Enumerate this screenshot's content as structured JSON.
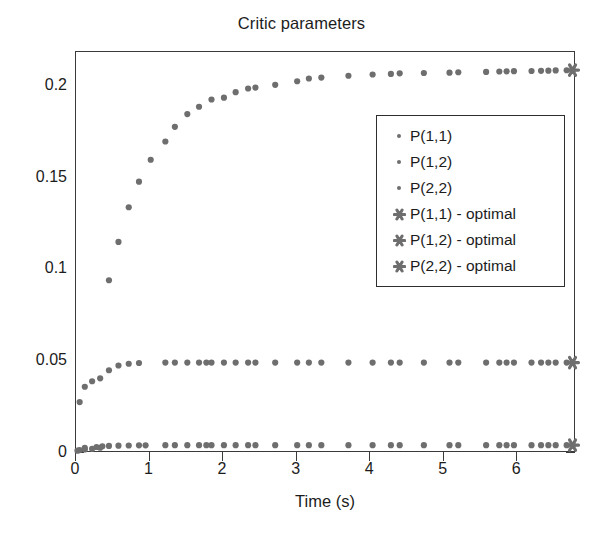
{
  "chart_data": {
    "type": "scatter",
    "title": "Critic parameters",
    "xlabel": "Time (s)",
    "ylabel": "",
    "xlim": [
      0,
      6.8
    ],
    "ylim": [
      0,
      0.2185
    ],
    "xticks": [
      0,
      1,
      2,
      3,
      4,
      5,
      6
    ],
    "xticklabels": [
      "0",
      "1",
      "2",
      "3",
      "4",
      "5",
      "6"
    ],
    "yticks": [
      0,
      0.05,
      0.1,
      0.15,
      0.2
    ],
    "yticklabels": [
      "0",
      "0.05",
      "0.1",
      "0.15",
      "0.2"
    ],
    "grid": false,
    "legend_position": "upper right (inside)",
    "marker_color": "#6e6e6e",
    "axis_color": "#3a3a3a",
    "series": [
      {
        "name": "P(1,1)",
        "marker": "dot",
        "color": "#6e6e6e",
        "x": [
          0.05,
          0.12,
          0.22,
          0.33,
          0.45,
          0.58,
          0.72,
          0.86,
          1.02,
          1.22,
          1.35,
          1.52,
          1.68,
          1.85,
          2.02,
          2.18,
          2.35,
          2.45,
          2.72,
          3.02,
          3.18,
          3.35,
          3.72,
          4.05,
          4.3,
          4.42,
          4.75,
          5.1,
          5.22,
          5.6,
          5.78,
          5.88,
          5.98,
          6.22,
          6.35,
          6.45,
          6.55,
          6.7,
          6.78
        ],
        "y": [
          0.0005,
          0.0008,
          0.0012,
          0.0018,
          0.0935,
          0.1145,
          0.1335,
          0.1475,
          0.1595,
          0.1695,
          0.1775,
          0.1845,
          0.1885,
          0.1925,
          0.1935,
          0.1965,
          0.1985,
          0.199,
          0.2005,
          0.2025,
          0.204,
          0.2045,
          0.2055,
          0.2062,
          0.2065,
          0.2068,
          0.207,
          0.2072,
          0.2074,
          0.2076,
          0.2078,
          0.2079,
          0.208,
          0.2081,
          0.2082,
          0.2083,
          0.2084,
          0.2085,
          0.2086
        ]
      },
      {
        "name": "P(1,2)",
        "marker": "dot",
        "color": "#6e6e6e",
        "x": [
          0.05,
          0.12,
          0.22,
          0.33,
          0.45,
          0.58,
          0.72,
          0.86,
          1.22,
          1.35,
          1.52,
          1.68,
          1.78,
          1.85,
          2.02,
          2.18,
          2.35,
          2.45,
          2.72,
          3.02,
          3.18,
          3.35,
          3.72,
          4.05,
          4.3,
          4.42,
          4.75,
          5.1,
          5.22,
          5.6,
          5.78,
          5.88,
          5.98,
          6.22,
          6.35,
          6.45,
          6.55,
          6.7,
          6.78
        ],
        "y": [
          0.0268,
          0.0352,
          0.0382,
          0.0398,
          0.0442,
          0.0468,
          0.0478,
          0.0482,
          0.0484,
          0.0484,
          0.0484,
          0.0484,
          0.0484,
          0.0484,
          0.0484,
          0.0484,
          0.0484,
          0.0484,
          0.0484,
          0.0484,
          0.0484,
          0.0484,
          0.0484,
          0.0484,
          0.0484,
          0.0484,
          0.0484,
          0.0484,
          0.0484,
          0.0484,
          0.0484,
          0.0484,
          0.0484,
          0.0484,
          0.0484,
          0.0484,
          0.0484,
          0.0484,
          0.0484
        ]
      },
      {
        "name": "P(2,2)",
        "marker": "dot",
        "color": "#6e6e6e",
        "x": [
          0.02,
          0.12,
          0.28,
          0.36,
          0.45,
          0.58,
          0.72,
          0.86,
          0.95,
          1.22,
          1.35,
          1.52,
          1.68,
          1.78,
          1.85,
          2.02,
          2.18,
          2.35,
          2.45,
          2.72,
          3.02,
          3.18,
          3.35,
          3.72,
          4.05,
          4.3,
          4.42,
          4.75,
          5.1,
          5.22,
          5.6,
          5.78,
          5.88,
          5.98,
          6.22,
          6.35,
          6.45,
          6.55,
          6.7,
          6.78
        ],
        "y": [
          0.0002,
          0.0018,
          0.0022,
          0.0026,
          0.0028,
          0.0029,
          0.003,
          0.0031,
          0.0031,
          0.0032,
          0.0032,
          0.0032,
          0.0032,
          0.0032,
          0.0032,
          0.0032,
          0.0032,
          0.0032,
          0.0032,
          0.0032,
          0.0032,
          0.0032,
          0.0032,
          0.0032,
          0.0032,
          0.0032,
          0.0032,
          0.0032,
          0.0032,
          0.0032,
          0.0032,
          0.0032,
          0.0032,
          0.0032,
          0.0032,
          0.0032,
          0.0032,
          0.0032,
          0.0032,
          0.0032
        ]
      },
      {
        "name": "P(1,1) - optimal",
        "marker": "star",
        "color": "#6e6e6e",
        "x": [
          6.78
        ],
        "y": [
          0.2086
        ]
      },
      {
        "name": "P(1,2) - optimal",
        "marker": "star",
        "color": "#6e6e6e",
        "x": [
          6.78
        ],
        "y": [
          0.0484
        ]
      },
      {
        "name": "P(2,2) - optimal",
        "marker": "star",
        "color": "#6e6e6e",
        "x": [
          6.78
        ],
        "y": [
          0.0032
        ]
      }
    ],
    "legend": [
      {
        "label": "P(1,1)",
        "marker": "dot"
      },
      {
        "label": "P(1,2)",
        "marker": "dot"
      },
      {
        "label": "P(2,2)",
        "marker": "dot"
      },
      {
        "label": "P(1,1) - optimal",
        "marker": "star"
      },
      {
        "label": "P(1,2) - optimal",
        "marker": "star"
      },
      {
        "label": "P(2,2) - optimal",
        "marker": "star"
      }
    ]
  }
}
